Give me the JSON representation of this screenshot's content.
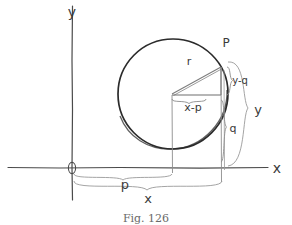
{
  "figure": {
    "caption": "Fig. 126",
    "axes": {
      "y_axis_label": "y",
      "x_axis_label": "x",
      "origin_label": "O"
    },
    "labels": {
      "point_p": "P",
      "radius": "r",
      "horizontal_leg": "x-p",
      "vertical_leg": "y-q",
      "center_height": "q",
      "total_height": "y",
      "center_abscissa": "p",
      "point_abscissa": "x"
    },
    "colors": {
      "ink": "#3a3a3a",
      "light_ink": "#8c8c8c",
      "circle": "#2b2b2b",
      "background": "#ffffff",
      "caption": "#6a6a6a"
    },
    "geometry": {
      "origin": [
        72,
        168
      ],
      "circle_center": [
        173,
        94
      ],
      "circle_radius": 55,
      "point_p": [
        221,
        67
      ]
    }
  }
}
